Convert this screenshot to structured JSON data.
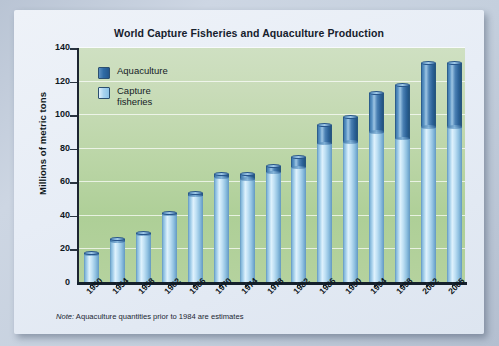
{
  "chart_data": {
    "type": "bar",
    "stacked": true,
    "title": "World Capture Fisheries and Aquaculture Production",
    "xlabel": "",
    "ylabel": "Millions of metric tons",
    "ylim": [
      0,
      140
    ],
    "ytick_step": 20,
    "yticks": [
      0,
      20,
      40,
      60,
      80,
      100,
      120,
      140
    ],
    "grid": true,
    "legend_position": "top-left",
    "categories": [
      "1950",
      "1954",
      "1958",
      "1962",
      "1966",
      "1970",
      "1974",
      "1978",
      "1982",
      "1986",
      "1990",
      "1994",
      "1998",
      "2002",
      "2005"
    ],
    "series": [
      {
        "name": "Capture fisheries",
        "color": "#a9d2ec",
        "values": [
          17,
          25,
          29,
          41,
          52,
          63,
          62,
          66,
          69,
          83,
          84,
          90,
          86,
          93,
          93
        ]
      },
      {
        "name": "Aquaculture",
        "color": "#2f6ba5",
        "values": [
          1,
          1,
          1,
          1,
          1.5,
          2,
          3,
          4,
          6,
          11,
          15,
          23,
          32,
          38,
          38
        ]
      }
    ],
    "totals": [
      18,
      26,
      30,
      42,
      53.5,
      65,
      65,
      70,
      75,
      94,
      99,
      113,
      118,
      131,
      131
    ],
    "note": "Note: Aquaculture quantities prior to 1984 are estimates",
    "note_prefix": "Note:",
    "note_body": " Aquaculture quantities prior to 1984 are estimates"
  },
  "legend": {
    "items": [
      {
        "label": "Aquaculture",
        "label_line1": "Aquaculture",
        "label_line2": "",
        "color": "#2f6ba5"
      },
      {
        "label": "Capture fisheries",
        "label_line1": "Capture",
        "label_line2": "fisheries",
        "color": "#a9d2ec"
      }
    ]
  },
  "axis": {
    "y_title": "Millions of metric tons",
    "y_labels": [
      "140",
      "120",
      "100",
      "80",
      "60",
      "40",
      "20",
      "0"
    ]
  },
  "colors": {
    "page_background": "#c8d2e0",
    "card_background": "#e9eff7",
    "plot_top": "#cfe0c2",
    "plot_bottom": "#aecf97",
    "aquaculture": "#2f6ba5",
    "capture": "#a9d2ec",
    "axis": "#14202c",
    "text": "#121a24"
  }
}
